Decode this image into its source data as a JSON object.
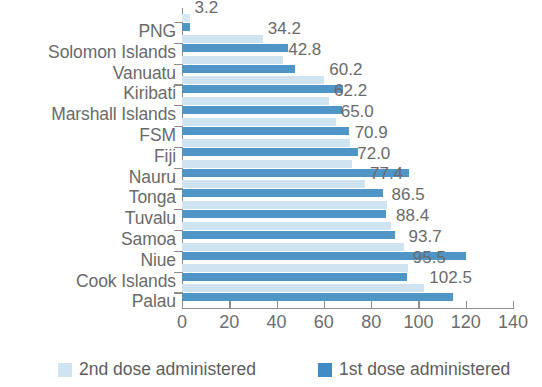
{
  "chart_data": {
    "type": "bar",
    "orientation": "horizontal",
    "title": "",
    "subtitle": "",
    "xlabel": "",
    "ylabel": "",
    "xlim": [
      0,
      140
    ],
    "xticks": [
      0,
      20,
      40,
      60,
      80,
      100,
      120,
      140
    ],
    "xtick_labels": [
      "0",
      "20",
      "40",
      "60",
      "80",
      "100",
      "120",
      "140"
    ],
    "grid": false,
    "legend_position": "bottom",
    "categories": [
      "PNG",
      "Solomon Islands",
      "Vanuatu",
      "Kiribati",
      "Marshall Islands",
      "FSM",
      "Fiji",
      "Nauru",
      "Tonga",
      "Tuvalu",
      "Samoa",
      "Niue",
      "Cook Islands",
      "Palau"
    ],
    "series": [
      {
        "name": "2nd dose administered",
        "color": "#cfe3f1",
        "values": [
          3.2,
          34.2,
          42.8,
          60.2,
          62.2,
          65.0,
          70.9,
          72.0,
          77.4,
          86.5,
          88.4,
          93.7,
          95.5,
          102.5
        ]
      },
      {
        "name": "1st dose administered",
        "color": "#4f96c7",
        "values": [
          3.2,
          45.0,
          48.0,
          68.0,
          67.5,
          70.5,
          74.5,
          96.0,
          85.0,
          86.3,
          90.2,
          120.0,
          95.0,
          114.5
        ]
      }
    ],
    "data_labels": [
      "3.2",
      "34.2",
      "42.8",
      "60.2",
      "62.2",
      "65.0",
      "70.9",
      "72.0",
      "77.4",
      "86.5",
      "88.4",
      "93.7",
      "95.5",
      "102.5"
    ],
    "data_label_series": "2nd dose administered"
  },
  "legend": {
    "items": [
      {
        "label": "2nd dose administered",
        "color": "#cfe3f1"
      },
      {
        "label": "1st dose administered",
        "color": "#3f8dc4"
      }
    ]
  },
  "colors": {
    "second_dose": "#cfe3f1",
    "first_dose": "#4f96c7",
    "axis": "#8d8d8d",
    "text": "#6a6a6a",
    "background": "#ffffff"
  }
}
